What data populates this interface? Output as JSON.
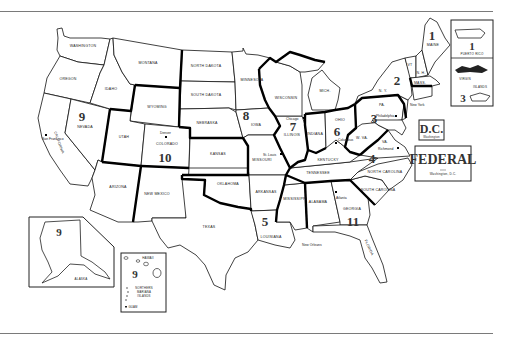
{
  "map": {
    "title": "Federal Regions of the United States",
    "states": {
      "washington": "WASHINGTON",
      "oregon": "OREGON",
      "california": "CALIFORNIA",
      "nevada": "NEVADA",
      "idaho": "IDAHO",
      "montana": "MONTANA",
      "wyoming": "WYOMING",
      "utah": "UTAH",
      "colorado": "COLORADO",
      "arizona": "ARIZONA",
      "new_mexico": "NEW MEXICO",
      "north_dakota": "NORTH DAKOTA",
      "south_dakota": "SOUTH DAKOTA",
      "nebraska": "NEBRASKA",
      "kansas": "KANSAS",
      "oklahoma": "OKLAHOMA",
      "texas": "TEXAS",
      "minnesota": "MINNESOTA",
      "iowa": "IOWA",
      "missouri": "MISSOURI",
      "arkansas": "ARKANSAS",
      "louisiana": "LOUISIANA",
      "wisconsin": "WISCONSIN",
      "illinois": "ILLINOIS",
      "michigan": "MICH.",
      "indiana": "INDIANA",
      "ohio": "OHIO",
      "kentucky": "KENTUCKY",
      "tennessee": "TENNESSEE",
      "mississippi": "MISSISSIPPI",
      "alabama": "ALABAMA",
      "georgia": "GEORGIA",
      "florida": "FLORIDA",
      "south_carolina": "SOUTH CAROLINA",
      "north_carolina": "NORTH CAROLINA",
      "virginia": "VA.",
      "west_virginia": "W. VA.",
      "pennsylvania": "PA.",
      "new_york": "N. Y.",
      "vermont": "VT",
      "new_hampshire": "N. H.",
      "maine": "MAINE",
      "massachusetts": "MASS.",
      "alaska": "ALASKA",
      "hawaii": "HAWAII"
    },
    "cities": {
      "seattle": "Seattle",
      "san_francisco": "San Francisco",
      "denver": "Denver",
      "st_louis": "St. Louis",
      "chicago": "Chicago",
      "columbus": "Columbus",
      "philadelphia": "Philadelphia",
      "richmond": "Richmond",
      "atlanta": "Atlanta",
      "new_orleans": "New Orleans",
      "new_york": "New York"
    },
    "regions": {
      "r1": "1",
      "r2": "2",
      "r3": "3",
      "r4": "4",
      "r5": "5",
      "r6": "6",
      "r7": "7",
      "r8": "8",
      "r9": "9",
      "r10": "10",
      "r11": "11"
    },
    "insets": {
      "puerto_rico": {
        "label": "PUERTO RICO",
        "region": "1"
      },
      "virgin_islands": {
        "label_line1": "VIRGIN",
        "label_line2": "ISLANDS",
        "region": "3"
      },
      "alaska": {
        "label": "ALASKA",
        "region": "9"
      },
      "hawaii": {
        "label": "HAWAII",
        "region": "9",
        "nmi_line1": "NORTHERN",
        "nmi_line2": "MARIANA",
        "nmi_line3": "ISLANDS",
        "guam": "GUAM"
      },
      "dc": {
        "title": "D.C.",
        "subtitle": "Washington"
      },
      "federal": {
        "title": "FEDERAL",
        "subtitle": "Washington, D.C."
      }
    }
  }
}
